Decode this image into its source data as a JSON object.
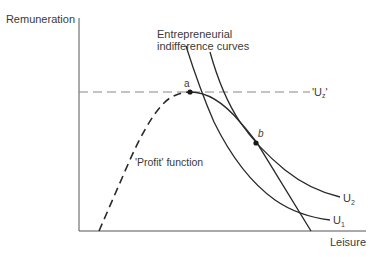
{
  "diagram": {
    "y_axis_label": "Remuneration",
    "x_axis_label": "Leisure",
    "curves_label_line1": "Entrepreneurial",
    "curves_label_line2": "indifference curves",
    "profit_label": "'Profit' function",
    "uz_label_open": "'U",
    "uz_label_sub": "z",
    "uz_label_close": "'",
    "u1_label": "U",
    "u1_sub": "1",
    "u2_label": "U",
    "u2_sub": "2",
    "point_a": "a",
    "point_b": "b",
    "colors": {
      "line": "#2a2a2a",
      "axis": "#555555",
      "dashed_ref": "#888888",
      "text": "#3a3a3a"
    }
  }
}
